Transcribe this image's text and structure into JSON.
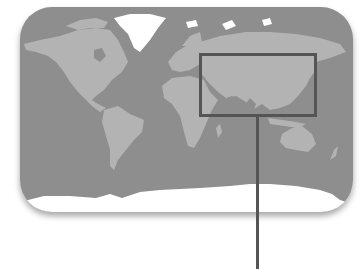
{
  "map": {
    "projection": "world-equirectangular",
    "colors": {
      "background": "#ffffff",
      "ocean": "#8e8e8e",
      "land": "#b3b3b3",
      "ice": "#ffffff",
      "highlight_border": "#555555",
      "leader_line": "#555555"
    },
    "frame": {
      "x": 20,
      "y": 7,
      "width": 333,
      "height": 205,
      "radius": 32
    },
    "highlight_region": {
      "label": "",
      "region": "asia",
      "x": 199,
      "y": 53,
      "width": 118,
      "height": 64,
      "stroke_width": 3
    },
    "leader_line": {
      "x": 257.5,
      "y1": 117,
      "y2": 269,
      "stroke_width": 3
    }
  }
}
